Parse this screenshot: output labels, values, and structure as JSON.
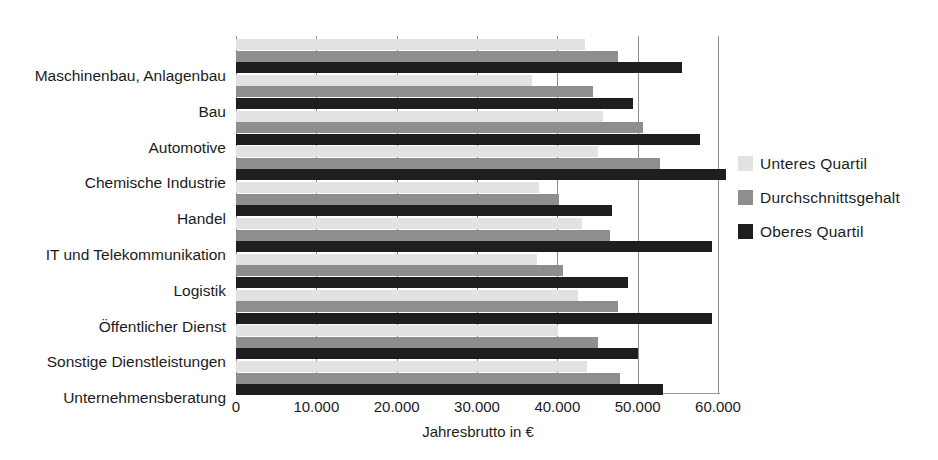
{
  "top_sliver_text": "",
  "axis": {
    "x_title": "Jahresbrutto in €",
    "x_ticks": [
      "0",
      "10.000",
      "20.000",
      "30.000",
      "40.000",
      "50.000",
      "60.000"
    ]
  },
  "legend": {
    "items": [
      {
        "label": "Unteres Quartil",
        "color": "#e2e2e2"
      },
      {
        "label": "Durchschnittsgehalt",
        "color": "#8e8e8e"
      },
      {
        "label": "Oberes Quartil",
        "color": "#1e1e1e"
      }
    ]
  },
  "chart_data": {
    "type": "bar",
    "orientation": "horizontal",
    "title": "",
    "xlabel": "Jahresbrutto in €",
    "ylabel": "",
    "xlim": [
      0,
      60000
    ],
    "xticks": [
      0,
      10000,
      20000,
      30000,
      40000,
      50000,
      60000
    ],
    "grid": true,
    "legend_position": "right",
    "categories": [
      "Maschinenbau, Anlagenbau",
      "Bau",
      "Automotive",
      "Chemische Industrie",
      "Handel",
      "IT und Telekommunikation",
      "Logistik",
      "Öffentlicher Dienst",
      "Sonstige Dienstleistungen",
      "Unternehmensberatung"
    ],
    "series": [
      {
        "name": "Unteres Quartil",
        "color": "#e2e2e2",
        "values": [
          43400,
          36800,
          45700,
          45000,
          37700,
          43100,
          37500,
          42600,
          40100,
          43700
        ]
      },
      {
        "name": "Durchschnittsgehalt",
        "color": "#8e8e8e",
        "values": [
          47500,
          44400,
          50700,
          52800,
          40200,
          46600,
          40700,
          47600,
          45000,
          47800
        ]
      },
      {
        "name": "Oberes Quartil",
        "color": "#1e1e1e",
        "values": [
          55500,
          49400,
          57800,
          61000,
          46800,
          59200,
          48800,
          59200,
          50100,
          53200
        ]
      }
    ]
  }
}
